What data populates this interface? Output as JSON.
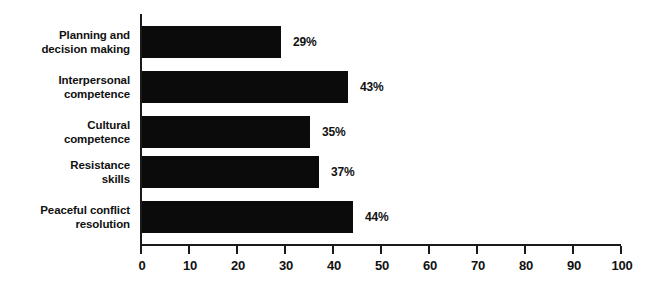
{
  "chart_data": {
    "type": "bar",
    "orientation": "horizontal",
    "title": "",
    "subtitle": "",
    "xlabel": "",
    "ylabel": "",
    "categories": [
      "Planning and decision making",
      "Interpersonal competence",
      "Cultural competence",
      "Resistance skills",
      "Peaceful conflict resolution"
    ],
    "values": [
      29,
      43,
      35,
      37,
      44
    ],
    "data_labels": [
      "29%",
      "43%",
      "35%",
      "37%",
      "44%"
    ],
    "xlim": [
      0,
      100
    ],
    "xticks": [
      0,
      10,
      20,
      30,
      40,
      50,
      60,
      70,
      80,
      90,
      100
    ],
    "xtick_labels": [
      "0",
      "10",
      "20",
      "30",
      "40",
      "50",
      "60",
      "70",
      "80",
      "90",
      "100"
    ],
    "grid": false,
    "legend": null,
    "bar_color": "#0b0b0b",
    "axis_color": "#1a1a1a",
    "background_color": "#ffffff"
  },
  "axis": {
    "tick_labels": [
      "0",
      "10",
      "20",
      "30",
      "40",
      "50",
      "60",
      "70",
      "80",
      "90",
      "100"
    ]
  },
  "bars": [
    {
      "label_line1": "Planning and",
      "label_line2": "decision making",
      "value": 29,
      "value_label": "29%"
    },
    {
      "label_line1": "Interpersonal",
      "label_line2": "competence",
      "value": 43,
      "value_label": "43%"
    },
    {
      "label_line1": "Cultural",
      "label_line2": "competence",
      "value": 35,
      "value_label": "35%"
    },
    {
      "label_line1": "Resistance",
      "label_line2": "skills",
      "value": 37,
      "value_label": "37%"
    },
    {
      "label_line1": "Peaceful conflict",
      "label_line2": "resolution",
      "value": 44,
      "value_label": "44%"
    }
  ]
}
